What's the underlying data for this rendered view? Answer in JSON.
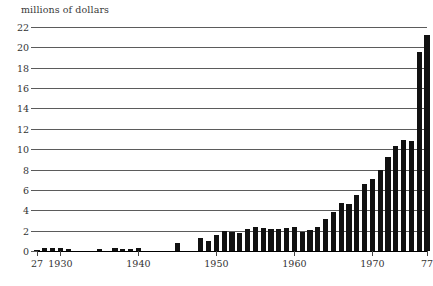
{
  "chart_data": {
    "type": "bar",
    "title": "",
    "axis_note": "millions of dollars",
    "xlabel": "",
    "ylabel": "millions of dollars",
    "ylim": [
      0,
      22
    ],
    "ytick_values": [
      0,
      2,
      4,
      6,
      8,
      10,
      12,
      14,
      16,
      18,
      20,
      22
    ],
    "ytick_labels": [
      "0",
      "2",
      "4",
      "6",
      "8",
      "10",
      "12",
      "14",
      "16",
      "18",
      "20",
      "22"
    ],
    "xlim": [
      1927,
      1977
    ],
    "xtick_values": [
      1927,
      1930,
      1940,
      1950,
      1960,
      1970,
      1977
    ],
    "xtick_labels": [
      "27",
      "1930",
      "1940",
      "1950",
      "1960",
      "1970",
      "77"
    ],
    "grid": "horizontal",
    "legend": "none",
    "bar_color": "#111111",
    "gridline_color": "#5b5b5b",
    "categories": [
      1927,
      1928,
      1929,
      1930,
      1931,
      1932,
      1933,
      1934,
      1935,
      1936,
      1937,
      1938,
      1939,
      1940,
      1941,
      1942,
      1943,
      1944,
      1945,
      1946,
      1947,
      1948,
      1949,
      1950,
      1951,
      1952,
      1953,
      1954,
      1955,
      1956,
      1957,
      1958,
      1959,
      1960,
      1961,
      1962,
      1963,
      1964,
      1965,
      1966,
      1967,
      1968,
      1969,
      1970,
      1971,
      1972,
      1973,
      1974,
      1975,
      1976,
      1977
    ],
    "values": [
      0.1,
      0.25,
      0.3,
      0.3,
      0.15,
      0.0,
      0.0,
      0.0,
      0.2,
      0.0,
      0.25,
      0.2,
      0.15,
      0.25,
      0.0,
      0.0,
      0.0,
      0.0,
      0.75,
      0.0,
      0.0,
      1.3,
      1.0,
      1.6,
      1.95,
      1.9,
      1.8,
      2.2,
      2.4,
      2.3,
      2.2,
      2.2,
      2.3,
      2.35,
      1.9,
      2.1,
      2.4,
      3.1,
      3.8,
      4.7,
      4.6,
      5.5,
      6.6,
      7.1,
      8.0,
      9.2,
      10.3,
      10.9,
      10.8,
      19.5,
      21.2
    ]
  }
}
